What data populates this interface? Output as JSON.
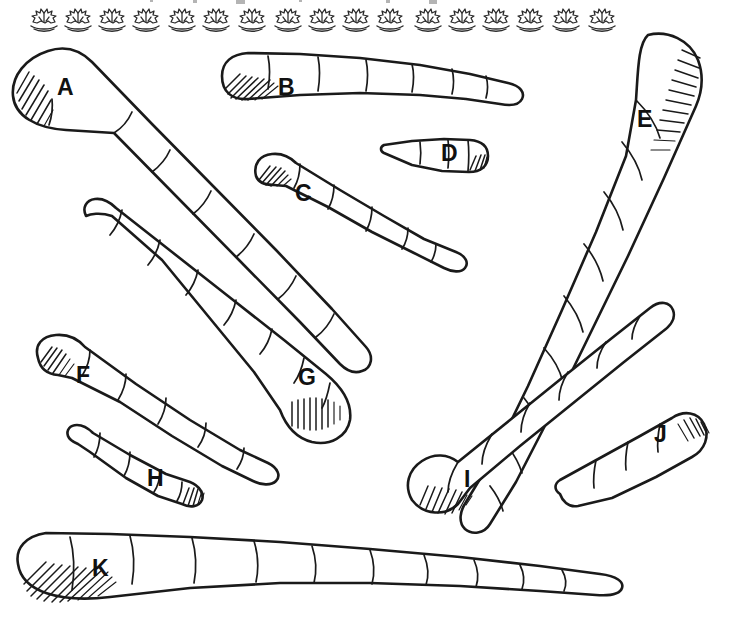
{
  "plate": {
    "background_color": "#ffffff",
    "ink_color": "#1a1a1a",
    "width": 731,
    "height": 617,
    "style": "ink line drawing / scientific illustration plate"
  },
  "header_ornament": {
    "name": "decorative-plant-motif-strip",
    "motif": "plant-sprig-on-ground-icon",
    "count": 17,
    "color": "#2b2b2b",
    "positions_x": [
      44,
      78,
      112,
      146,
      182,
      216,
      252,
      288,
      322,
      356,
      390,
      428,
      462,
      496,
      530,
      566,
      602
    ],
    "baseline_y": 26,
    "cropped_text_above": true
  },
  "specimens": [
    {
      "id": "A",
      "label": "A",
      "label_x": 57,
      "label_y": 76,
      "hatched_end": "left-rounded-cap",
      "orientation": "diagonal-down-right",
      "segments": 8
    },
    {
      "id": "B",
      "label": "B",
      "label_x": 278,
      "label_y": 76,
      "hatched_end": "left-rounded-cap",
      "orientation": "horizontal-tapering-right",
      "segments": 8
    },
    {
      "id": "C",
      "label": "C",
      "label_x": 295,
      "label_y": 182,
      "hatched_end": "left-rounded-cap",
      "orientation": "diagonal-down-right",
      "segments": 6
    },
    {
      "id": "D",
      "label": "D",
      "label_x": 441,
      "label_y": 142,
      "hatched_end": "right-rounded-cap",
      "orientation": "horizontal-tapering-left",
      "segments": 4
    },
    {
      "id": "E",
      "label": "E",
      "label_x": 637,
      "label_y": 108,
      "hatched_end": "top-right-cap",
      "orientation": "diagonal-down-left",
      "segments": 10
    },
    {
      "id": "F",
      "label": "F",
      "label_x": 76,
      "label_y": 364,
      "hatched_end": "left-rounded-cap",
      "orientation": "diagonal-down-right",
      "segments": 6
    },
    {
      "id": "G",
      "label": "G",
      "label_x": 298,
      "label_y": 366,
      "hatched_end": "bottom-right-bulb",
      "orientation": "diagonal-up-left",
      "segments": 9
    },
    {
      "id": "H",
      "label": "H",
      "label_x": 147,
      "label_y": 467,
      "hatched_end": "right-wide-cap",
      "orientation": "diagonal-down-right",
      "segments": 5
    },
    {
      "id": "I",
      "label": "I",
      "label_x": 464,
      "label_y": 468,
      "hatched_end": "bottom-left-cap",
      "orientation": "diagonal-up-right",
      "segments": 7
    },
    {
      "id": "J",
      "label": "J",
      "label_x": 654,
      "label_y": 423,
      "hatched_end": "right-rounded-cap",
      "orientation": "diagonal-up-right",
      "segments": 6
    },
    {
      "id": "K",
      "label": "K",
      "label_x": 92,
      "label_y": 557,
      "hatched_end": "left-rounded-cap",
      "orientation": "horizontal-tapering-right",
      "segments": 11
    }
  ]
}
